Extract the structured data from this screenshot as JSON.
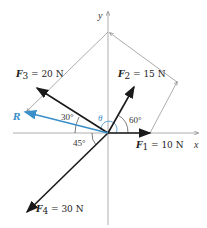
{
  "axes": {
    "x_label": "x",
    "y_label": "y"
  },
  "forces": [
    {
      "name": "F1",
      "sym": "F",
      "sub": "1",
      "eq": " = 10 N",
      "magnitude_N": 10,
      "angle_label": ""
    },
    {
      "name": "F2",
      "sym": "F",
      "sub": "2",
      "eq": " = 15 N",
      "magnitude_N": 15,
      "angle_label": "60°"
    },
    {
      "name": "F3",
      "sym": "F",
      "sub": "3",
      "eq": " = 20 N",
      "magnitude_N": 20,
      "angle_label": "30°"
    },
    {
      "name": "F4",
      "sym": "F",
      "sub": "4",
      "eq": " = 30 N",
      "magnitude_N": 30,
      "angle_label": "45°"
    }
  ],
  "resultant": {
    "label": "R",
    "angle_label": "θ",
    "color": "#3a8fc9"
  },
  "colors": {
    "force": "#1a1a1a",
    "construction": "#777777",
    "resultant": "#3a8fc9"
  }
}
